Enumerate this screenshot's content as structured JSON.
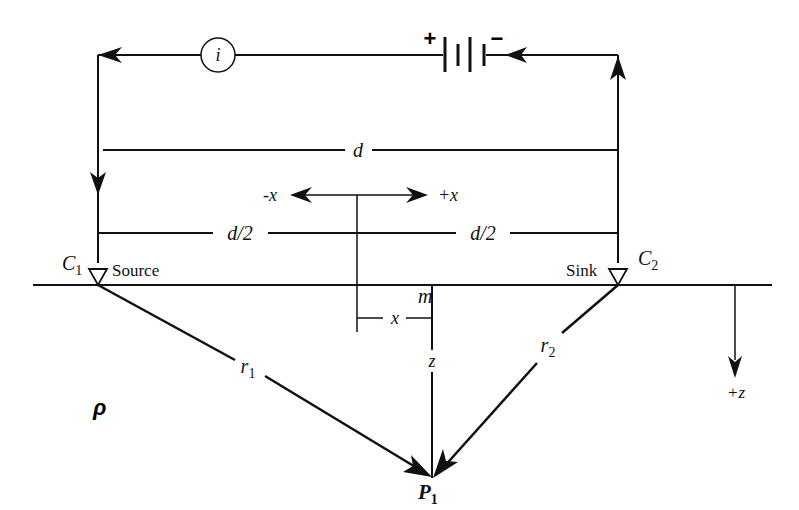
{
  "diagram": {
    "type": "electrical-resistivity-electrode-array",
    "colors": {
      "line": "#111111",
      "background": "#ffffff"
    },
    "circuit": {
      "current_meter_label": "i",
      "battery_plus": "+",
      "battery_minus": "−"
    },
    "dimensions": {
      "full_spacing": "d",
      "half_spacing_left": "d/2",
      "half_spacing_right": "d/2"
    },
    "axes": {
      "neg_x": "-x",
      "pos_x": "+x",
      "offset_x": "x",
      "depth_z": "z",
      "pos_z": "+z"
    },
    "electrodes": {
      "source": {
        "name": "C",
        "subscript": "1",
        "role": "Source"
      },
      "sink": {
        "name": "C",
        "subscript": "2",
        "role": "Sink"
      }
    },
    "points": {
      "midpoint": "m",
      "observation": {
        "name": "P",
        "subscript": "1"
      }
    },
    "distances": {
      "r1": {
        "name": "r",
        "subscript": "1"
      },
      "r2": {
        "name": "r",
        "subscript": "2"
      }
    },
    "medium": {
      "resistivity": "ρ"
    }
  }
}
